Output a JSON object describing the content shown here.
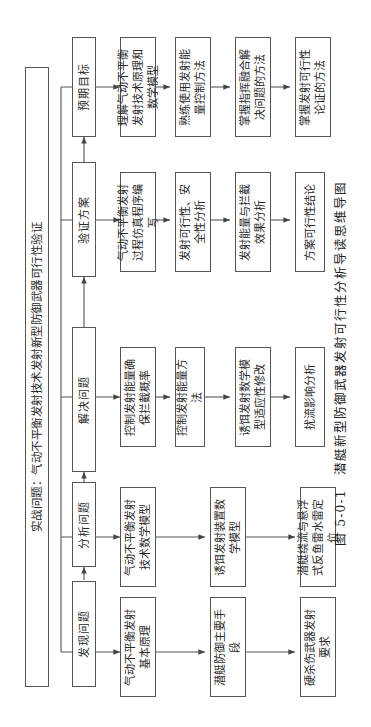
{
  "top_banner": {
    "label": "实战问题：气动不平衡发射技术发射新型防御武器可行性验证"
  },
  "stages": [
    {
      "id": "discover",
      "label": "发现问题",
      "items": [
        "气动不平衡发射基本原理",
        "潜艇防御主要手段",
        "硬杀伤武器发射要求"
      ]
    },
    {
      "id": "analyze",
      "label": "分析问题",
      "items": [
        "气动不平衡发射技术数学模型",
        "诱饵发射装置数学模型",
        "潜艇绕流与悬浮式反鱼雷水雷定位"
      ]
    },
    {
      "id": "solve",
      "label": "解决问题",
      "items": [
        "控制发射能量确保拦截概率",
        "控制发射能量方法",
        "诱饵发射数学模型适应性修改",
        "扰流影响分析"
      ]
    },
    {
      "id": "verify",
      "label": "验证方案",
      "items": [
        "气动不平衡发射过程仿真程序编写",
        "发射可行性、安全性分析",
        "发射能量与拦截效果分析",
        "方案可行性结论"
      ]
    },
    {
      "id": "goals",
      "label": "预期目标",
      "items": [
        "理解气动不平衡发射技术原理和数学模型",
        "熟练使用发射能量控制方法",
        "掌握指挥融合解决问题的方法",
        "掌握发射可行性论证的方法"
      ]
    }
  ],
  "caption": {
    "number": "图 5-0-1",
    "title": "潜艇新型防御武器发射可行性分析导读思维导图"
  },
  "colors": {
    "line": "#555555",
    "text": "#2a2a2a",
    "background": "#ffffff"
  }
}
